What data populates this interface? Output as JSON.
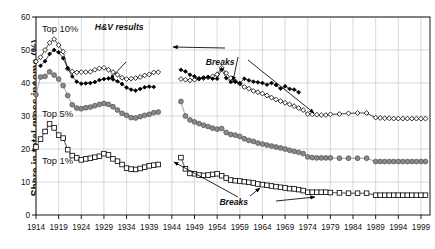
{
  "chart_data": {
    "type": "line",
    "title": "",
    "xlabel": "",
    "ylabel": "Share in total gross income (%)",
    "xlim": [
      1914,
      2001
    ],
    "ylim": [
      0,
      60
    ],
    "yticks": [
      0,
      10,
      20,
      30,
      40,
      50,
      60
    ],
    "xticks": [
      1914,
      1919,
      1924,
      1929,
      1934,
      1939,
      1944,
      1949,
      1954,
      1959,
      1964,
      1969,
      1974,
      1979,
      1984,
      1989,
      1994,
      1999
    ],
    "grid": true,
    "legend_position": "inline-labels",
    "annotations": [
      {
        "text": "Top 10%",
        "x": 1916.5,
        "y": 57.0
      },
      {
        "text": "Top 5%",
        "x": 1916.5,
        "y": 31.0
      },
      {
        "text": "Top 1%",
        "x": 1916.5,
        "y": 16.8
      },
      {
        "text": "H&V results",
        "x": 1928.5,
        "y": 57.2,
        "style": "italic"
      },
      {
        "text": "Breaks",
        "x": 1952.2,
        "y": 47.5,
        "style": "italic"
      },
      {
        "text": "Breaks",
        "x": 1955.0,
        "y": 4.6,
        "style": "italic"
      }
    ],
    "series": [
      {
        "name": "Top 10%",
        "marker": "open-diamond",
        "color": "#000000",
        "fill": "#ffffff",
        "x": [
          1914,
          1915,
          1916,
          1917,
          1918,
          1919,
          1920,
          1921,
          1922,
          1923,
          1924,
          1925,
          1926,
          1927,
          1928,
          1929,
          1930,
          1931,
          1932,
          1933,
          1934,
          1935,
          1936,
          1937,
          1938,
          1939,
          1940,
          1941,
          1946,
          1947,
          1948,
          1949,
          1950,
          1951,
          1952,
          1953,
          1954,
          1955,
          1956,
          1957,
          1958,
          1959,
          1960,
          1961,
          1962,
          1963,
          1964,
          1965,
          1966,
          1967,
          1968,
          1969,
          1970,
          1971,
          1972,
          1973,
          1974,
          1975,
          1976,
          1977,
          1978,
          1979,
          1981,
          1983,
          1985,
          1987,
          1989,
          1990,
          1991,
          1992,
          1993,
          1994,
          1995,
          1996,
          1997,
          1998,
          1999,
          2000
        ],
        "y": [
          46.5,
          47.8,
          50.0,
          52.2,
          53.3,
          51.5,
          49.5,
          44.3,
          43.5,
          43.2,
          43.3,
          43.3,
          43.4,
          44.0,
          44.4,
          44.6,
          44.0,
          43.3,
          42.5,
          41.6,
          41.2,
          41.3,
          41.5,
          41.8,
          42.3,
          42.6,
          43.2,
          43.3,
          41.2,
          41.0,
          40.8,
          41.0,
          41.3,
          41.5,
          41.7,
          42.0,
          42.6,
          44.6,
          43.0,
          41.5,
          40.5,
          39.8,
          38.8,
          38.3,
          37.6,
          37.2,
          36.8,
          36.2,
          35.6,
          35.0,
          34.5,
          34.0,
          33.5,
          33.0,
          32.4,
          31.8,
          30.6,
          30.5,
          30.4,
          30.3,
          30.3,
          30.5,
          30.6,
          30.8,
          30.9,
          30.9,
          29.5,
          29.4,
          29.3,
          29.3,
          29.2,
          29.2,
          29.2,
          29.2,
          29.2,
          29.2,
          29.2,
          29.2
        ]
      },
      {
        "name": "H&V results",
        "marker": "filled-diamond",
        "color": "#000000",
        "fill": "#000000",
        "x": [
          1915,
          1916,
          1917,
          1918,
          1919,
          1920,
          1921,
          1922,
          1923,
          1924,
          1925,
          1926,
          1927,
          1928,
          1929,
          1930,
          1931,
          1932,
          1933,
          1934,
          1935,
          1936,
          1937,
          1938,
          1939,
          1940,
          1946,
          1947,
          1948,
          1949,
          1950,
          1951,
          1952,
          1953,
          1954,
          1955,
          1956,
          1957,
          1958,
          1959,
          1960,
          1961,
          1962,
          1963,
          1964,
          1965,
          1966,
          1967,
          1968,
          1969,
          1970,
          1971,
          1972
        ],
        "y": [
          45.2,
          46.6,
          48.8,
          50.0,
          49.3,
          47.5,
          44.5,
          42.0,
          40.4,
          39.8,
          39.9,
          40.0,
          40.3,
          40.9,
          41.2,
          41.4,
          41.1,
          40.5,
          39.7,
          38.6,
          38.0,
          37.7,
          38.2,
          38.7,
          38.9,
          38.8,
          44.0,
          43.5,
          42.5,
          42.0,
          41.3,
          41.6,
          41.8,
          41.3,
          41.3,
          44.1,
          41.5,
          40.3,
          40.4,
          39.9,
          41.3,
          40.8,
          40.4,
          40.2,
          40.0,
          39.5,
          40.0,
          39.4,
          38.3,
          39.0,
          38.2,
          38.0,
          37.2
        ]
      },
      {
        "name": "Top 5%",
        "marker": "filled-circle",
        "color": "#7a7a7a",
        "fill": "#8a8a8a",
        "x": [
          1914,
          1915,
          1916,
          1917,
          1918,
          1919,
          1920,
          1921,
          1922,
          1923,
          1924,
          1925,
          1926,
          1927,
          1928,
          1929,
          1930,
          1931,
          1932,
          1933,
          1934,
          1935,
          1936,
          1937,
          1938,
          1939,
          1940,
          1941,
          1946,
          1947,
          1948,
          1949,
          1950,
          1951,
          1952,
          1953,
          1954,
          1955,
          1956,
          1957,
          1958,
          1959,
          1960,
          1961,
          1962,
          1963,
          1964,
          1965,
          1966,
          1967,
          1968,
          1969,
          1970,
          1971,
          1972,
          1973,
          1974,
          1975,
          1976,
          1977,
          1978,
          1979,
          1981,
          1983,
          1985,
          1987,
          1989,
          1990,
          1991,
          1992,
          1993,
          1994,
          1995,
          1996,
          1997,
          1998,
          1999,
          2000
        ],
        "y": [
          36.5,
          41.8,
          42.0,
          43.4,
          42.4,
          41.2,
          39.2,
          36.2,
          33.4,
          32.4,
          32.2,
          32.5,
          32.7,
          33.1,
          33.5,
          33.8,
          33.5,
          32.8,
          31.8,
          30.8,
          30.2,
          29.5,
          29.4,
          29.8,
          30.2,
          30.5,
          31.0,
          31.2,
          34.4,
          30.0,
          28.8,
          28.2,
          27.7,
          27.2,
          26.8,
          26.3,
          26.0,
          26.2,
          25.0,
          24.4,
          24.2,
          23.8,
          23.1,
          22.6,
          22.3,
          21.8,
          21.5,
          21.2,
          20.9,
          20.6,
          20.3,
          20.0,
          19.6,
          19.3,
          19.0,
          18.6,
          17.6,
          17.4,
          17.3,
          17.3,
          17.3,
          17.3,
          17.2,
          17.2,
          17.2,
          17.2,
          16.2,
          16.2,
          16.2,
          16.2,
          16.2,
          16.2,
          16.2,
          16.2,
          16.2,
          16.2,
          16.2,
          16.2
        ]
      },
      {
        "name": "Top 1%",
        "marker": "open-square",
        "color": "#000000",
        "fill": "#ffffff",
        "x": [
          1914,
          1915,
          1916,
          1917,
          1918,
          1919,
          1920,
          1921,
          1922,
          1923,
          1924,
          1925,
          1926,
          1927,
          1928,
          1929,
          1930,
          1931,
          1932,
          1933,
          1934,
          1935,
          1936,
          1937,
          1938,
          1939,
          1940,
          1941,
          1946,
          1947,
          1948,
          1949,
          1950,
          1951,
          1952,
          1953,
          1954,
          1955,
          1956,
          1957,
          1958,
          1959,
          1960,
          1961,
          1962,
          1963,
          1964,
          1965,
          1966,
          1967,
          1968,
          1969,
          1970,
          1971,
          1972,
          1973,
          1974,
          1975,
          1976,
          1977,
          1978,
          1979,
          1981,
          1983,
          1985,
          1987,
          1989,
          1990,
          1991,
          1992,
          1993,
          1994,
          1995,
          1996,
          1997,
          1998,
          1999,
          2000
        ],
        "y": [
          20.6,
          23.0,
          25.3,
          27.6,
          26.4,
          24.2,
          23.3,
          19.8,
          18.0,
          17.3,
          16.7,
          17.0,
          17.2,
          17.5,
          17.8,
          18.6,
          18.2,
          17.0,
          16.3,
          15.3,
          14.2,
          13.9,
          13.8,
          14.1,
          14.5,
          14.9,
          15.1,
          15.3,
          17.4,
          14.0,
          12.6,
          12.5,
          12.1,
          12.0,
          12.1,
          12.3,
          12.5,
          11.9,
          11.2,
          10.6,
          10.4,
          10.3,
          10.1,
          9.9,
          9.7,
          9.4,
          9.2,
          9.0,
          8.8,
          8.6,
          8.4,
          8.2,
          8.0,
          7.9,
          7.7,
          7.4,
          6.9,
          6.9,
          6.9,
          6.9,
          6.9,
          6.8,
          6.7,
          6.6,
          6.6,
          6.6,
          6.0,
          6.0,
          6.0,
          6.0,
          6.0,
          6.0,
          6.0,
          6.0,
          6.0,
          6.0,
          6.0,
          6.0
        ]
      }
    ]
  },
  "axis": {
    "y_title": "Share in total gross income (%)",
    "y_tick_labels": [
      "0",
      "10",
      "20",
      "30",
      "40",
      "50",
      "60"
    ],
    "x_tick_labels": [
      "1914",
      "1919",
      "1924",
      "1929",
      "1934",
      "1939",
      "1944",
      "1949",
      "1954",
      "1959",
      "1964",
      "1969",
      "1974",
      "1979",
      "1984",
      "1989",
      "1994",
      "1999"
    ]
  },
  "labels": {
    "top10": "Top 10%",
    "top5": "Top 5%",
    "top1": "Top 1%",
    "hv": "H&V results",
    "breaks_upper": "Breaks",
    "breaks_lower": "Breaks"
  },
  "colors": {
    "axis": "#000000",
    "grid": "#c9c9c9",
    "top10": "#000000",
    "hv": "#000000",
    "top5": "#8a8a8a",
    "top1": "#000000"
  }
}
